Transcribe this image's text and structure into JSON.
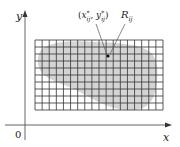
{
  "diagram": {
    "axes": {
      "x_label": "x",
      "y_label": "y",
      "origin_label": "0",
      "axis_color": "#555555"
    },
    "grid": {
      "left": 35,
      "top": 40,
      "width": 128,
      "height": 70,
      "columns": 18,
      "rows": 10,
      "line_color": "#333333"
    },
    "region": {
      "fill_color": "#d4d4d4"
    },
    "annotations": {
      "sample_point_label_x": "x",
      "sample_point_label_y": "y",
      "sample_point_sup": "*",
      "sample_point_sub": "ij",
      "rectangle_label": "R",
      "rectangle_sub": "ij",
      "point": {
        "x": 108,
        "y": 56
      }
    }
  }
}
